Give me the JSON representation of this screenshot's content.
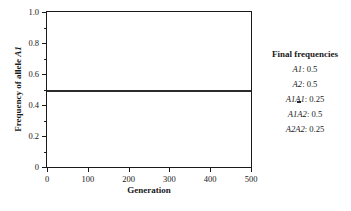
{
  "chart_data": {
    "type": "line",
    "title": "",
    "xlabel": "Generation",
    "ylabel": "Frequency of allele A1",
    "ylabel_plain": "Frequency of allele ",
    "ylabel_italic": "A1",
    "xlim": [
      0,
      500
    ],
    "ylim": [
      0,
      1.0
    ],
    "grid": false,
    "legend_position": "right-outside",
    "x_ticks": [
      {
        "value": 0,
        "label": "0"
      },
      {
        "value": 100,
        "label": "100"
      },
      {
        "value": 200,
        "label": "200"
      },
      {
        "value": 300,
        "label": "300"
      },
      {
        "value": 400,
        "label": "400"
      },
      {
        "value": 500,
        "label": "500"
      }
    ],
    "y_ticks": [
      {
        "value": 0,
        "label": "0"
      },
      {
        "value": 0.2,
        "label": "0.2"
      },
      {
        "value": 0.4,
        "label": "0.4"
      },
      {
        "value": 0.6,
        "label": "0.6"
      },
      {
        "value": 0.8,
        "label": "0.8"
      },
      {
        "value": 1.0,
        "label": "1.0"
      }
    ],
    "y_minor_ticks": [
      0.1,
      0.3,
      0.5,
      0.7,
      0.9
    ],
    "series": [
      {
        "name": "Frequency of allele A1",
        "color": "#2b2b2b",
        "x": [
          0,
          50,
          100,
          150,
          200,
          250,
          300,
          350,
          400,
          450,
          500
        ],
        "values": [
          0.5,
          0.5,
          0.5,
          0.5,
          0.5,
          0.5,
          0.5,
          0.5,
          0.5,
          0.5,
          0.5
        ]
      }
    ]
  },
  "legend": {
    "title": "Final frequencies",
    "rows": [
      {
        "name": "A1",
        "value": "0.5",
        "text": "A1: 0.5"
      },
      {
        "name": "A2",
        "value": "0.5",
        "text": "A2: 0.5"
      },
      {
        "name": "A1A1",
        "value": "0.25",
        "text": "A1A1: 0.25"
      },
      {
        "name": "A1A2",
        "value": "0.5",
        "text": "A1A2: 0.5"
      },
      {
        "name": "A2A2",
        "value": "0.25",
        "text": "A2A2: 0.25"
      }
    ]
  },
  "caption": {
    "text": ""
  },
  "colors": {
    "line": "#2b2b2b",
    "axis": "#1a1a1a",
    "background": "#ffffff"
  }
}
